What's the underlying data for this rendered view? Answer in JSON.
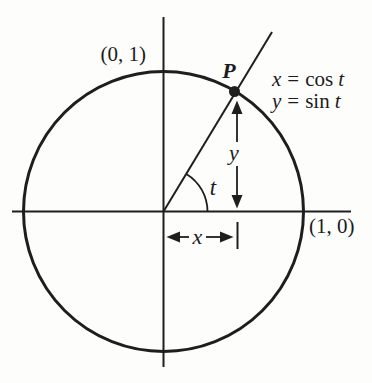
{
  "figure": {
    "labels": {
      "top_intercept": "(0, 1)",
      "right_intercept": "(1, 0)",
      "point": "P",
      "angle": "t",
      "horizontal_leg": "x",
      "vertical_leg": "y"
    },
    "equations": {
      "eq1": {
        "lhs": "x",
        "rel": "=",
        "fn": "cos",
        "arg": "t"
      },
      "eq2": {
        "lhs": "y",
        "rel": "=",
        "fn": "sin",
        "arg": "t"
      }
    },
    "colors": {
      "ink": "#1e1e1e",
      "background": "#fdfdfc"
    }
  }
}
